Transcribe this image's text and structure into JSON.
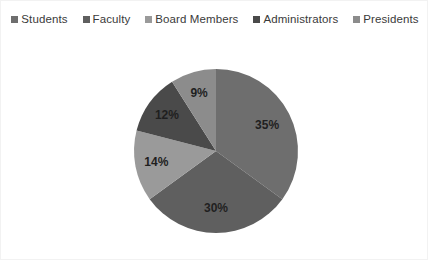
{
  "legend": {
    "position": "top",
    "items": [
      {
        "label": "Students",
        "color": "#6e6e6e",
        "marker": "square-marker-icon"
      },
      {
        "label": "Faculty",
        "color": "#5f5f5f",
        "marker": "square-marker-icon"
      },
      {
        "label": "Board Members",
        "color": "#9a9a9a",
        "marker": "square-marker-icon"
      },
      {
        "label": "Administrators",
        "color": "#4a4a4a",
        "marker": "square-marker-icon"
      },
      {
        "label": "Presidents",
        "color": "#8c8c8c",
        "marker": "square-marker-icon"
      }
    ]
  },
  "chart_data": {
    "type": "pie",
    "title": "",
    "subtitle": "",
    "xlabel": "",
    "ylabel": "",
    "grid": false,
    "legend_position": "top",
    "categories": [
      "Students",
      "Faculty",
      "Board Members",
      "Administrators",
      "Presidents"
    ],
    "values": [
      35,
      30,
      14,
      12,
      9
    ],
    "units": "%",
    "data_labels": [
      "35%",
      "30%",
      "14%",
      "12%",
      "9%"
    ],
    "colors": [
      "#6e6e6e",
      "#5f5f5f",
      "#9a9a9a",
      "#4a4a4a",
      "#8c8c8c"
    ],
    "label_colors": [
      "#1f1f1f",
      "#1f1f1f",
      "#1f1f1f",
      "#1f1f1f",
      "#1f1f1f"
    ],
    "start_angle_deg": 0,
    "direction": "clockwise",
    "center": {
      "x": 215,
      "y": 122
    },
    "radius": 82
  }
}
